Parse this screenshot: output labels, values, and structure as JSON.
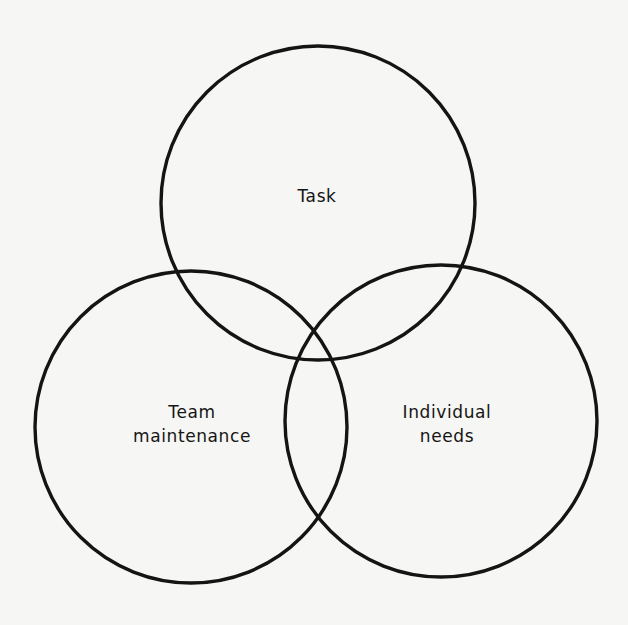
{
  "diagram": {
    "type": "venn-3",
    "title": "",
    "circles": [
      {
        "id": "task",
        "label_lines": [
          "Task"
        ],
        "cx": 318,
        "cy": 203,
        "r": 157
      },
      {
        "id": "team-maintenance",
        "label_lines": [
          "Team",
          "maintenance"
        ],
        "cx": 191,
        "cy": 427,
        "r": 156
      },
      {
        "id": "individual-needs",
        "label_lines": [
          "Individual",
          "needs"
        ],
        "cx": 441,
        "cy": 421,
        "r": 156
      }
    ],
    "stroke_color": "#141414",
    "background_color": "#f6f6f4"
  },
  "labels": {
    "task": {
      "line1": "Task"
    },
    "team": {
      "line1": "Team",
      "line2": "maintenance"
    },
    "individual": {
      "line1": "Individual",
      "line2": "needs"
    }
  }
}
